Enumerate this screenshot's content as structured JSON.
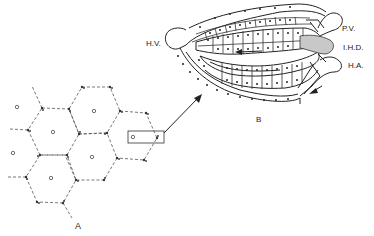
{
  "figure": {
    "panel_a": {
      "label": "A",
      "description": "Hexagonal hepatic lobules with central veins (circles) and portal triads at corners"
    },
    "panel_b": {
      "label": "B",
      "description": "Enlarged portal region showing hepatocyte plates and bile duct",
      "labels": {
        "hepatic_vein": "H.V.",
        "portal_vein": "P.V.",
        "interlobular_hepatic_duct": "I.H.D.",
        "hepatic_artery": "H.A."
      }
    },
    "colors": {
      "line": "#222222",
      "dashed": "#555555",
      "duct_fill": "#c8c8c8",
      "background": "#ffffff"
    }
  }
}
